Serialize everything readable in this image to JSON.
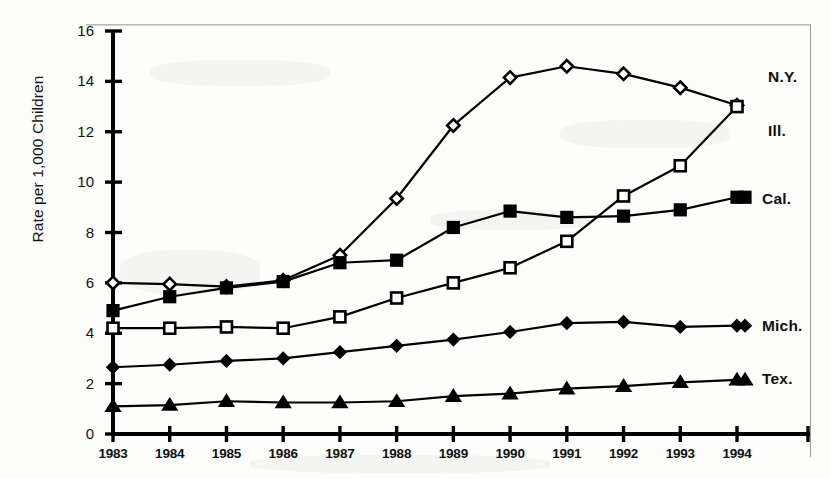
{
  "chart_data": {
    "type": "line",
    "title": "",
    "xlabel": "",
    "ylabel": "Rate per 1,000 Children",
    "x": [
      1983,
      1984,
      1985,
      1986,
      1987,
      1988,
      1989,
      1990,
      1991,
      1992,
      1993,
      1994
    ],
    "xtick_labels": [
      "1983",
      "1984",
      "1985",
      "1986",
      "1987",
      "1988",
      "1989",
      "1990",
      "1991",
      "1992",
      "1993",
      "1994"
    ],
    "ytick_labels": [
      "0",
      "2",
      "4",
      "6",
      "8",
      "10",
      "12",
      "14",
      "16"
    ],
    "yticks": [
      0,
      2,
      4,
      6,
      8,
      10,
      12,
      14,
      16
    ],
    "ylim": [
      0,
      16
    ],
    "xlim": [
      1983,
      1995
    ],
    "grid": false,
    "legend_position": "right-inline-end-of-line",
    "series": [
      {
        "name": "N.Y.",
        "label": "N.Y.",
        "marker": "open-diamond",
        "color": "#000000",
        "values": [
          6.0,
          5.95,
          5.85,
          6.1,
          7.1,
          9.35,
          12.25,
          14.15,
          14.6,
          14.3,
          13.75,
          13.05
        ]
      },
      {
        "name": "Ill.",
        "label": "Ill.",
        "marker": "open-square",
        "color": "#000000",
        "values": [
          4.2,
          4.2,
          4.25,
          4.2,
          4.65,
          5.4,
          6.0,
          6.6,
          7.65,
          9.45,
          10.65,
          13.0
        ]
      },
      {
        "name": "Cal.",
        "label": "Cal.",
        "marker": "filled-square",
        "color": "#000000",
        "values": [
          4.9,
          5.45,
          5.8,
          6.05,
          6.8,
          6.9,
          8.2,
          8.85,
          8.6,
          8.65,
          8.9,
          9.4
        ]
      },
      {
        "name": "Mich.",
        "label": "Mich.",
        "marker": "filled-diamond",
        "color": "#000000",
        "values": [
          2.65,
          2.75,
          2.9,
          3.0,
          3.25,
          3.5,
          3.75,
          4.05,
          4.4,
          4.45,
          4.25,
          4.3
        ]
      },
      {
        "name": "Tex.",
        "label": "Tex.",
        "marker": "filled-triangle",
        "color": "#000000",
        "values": [
          1.1,
          1.15,
          1.3,
          1.25,
          1.25,
          1.3,
          1.5,
          1.6,
          1.8,
          1.9,
          2.05,
          2.15
        ]
      }
    ],
    "series_label_positions": [
      {
        "name": "N.Y.",
        "left": 768,
        "top": 68
      },
      {
        "name": "Ill.",
        "left": 768,
        "top": 122
      },
      {
        "name": "Cal.",
        "left": 762,
        "top": 190
      },
      {
        "name": "Mich.",
        "left": 762,
        "top": 317
      },
      {
        "name": "Tex.",
        "left": 762,
        "top": 370
      }
    ]
  },
  "axis": {
    "y_title": "Rate per 1,000 Children"
  }
}
